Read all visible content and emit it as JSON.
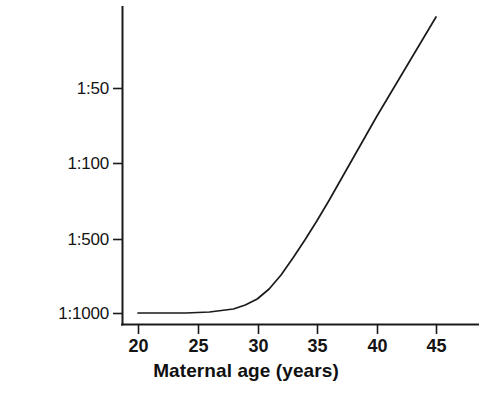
{
  "chart_data": {
    "type": "line",
    "title": "",
    "xlabel": "Maternal age (years)",
    "ylabel": "Frequency",
    "xlim": [
      20,
      45
    ],
    "ylim_labels": [
      "1:1000",
      "1:500",
      "1:100",
      "1:50"
    ],
    "grid": false,
    "legend": null,
    "axis_color": "#1a1a1a",
    "line_color": "#1a1a1a",
    "x_ticks": [
      {
        "label": "20",
        "value": 20,
        "px": 138
      },
      {
        "label": "25",
        "value": 25,
        "px": 198
      },
      {
        "label": "30",
        "value": 30,
        "px": 258
      },
      {
        "label": "35",
        "value": 35,
        "px": 317
      },
      {
        "label": "40",
        "value": 40,
        "px": 377
      },
      {
        "label": "45",
        "value": 45,
        "px": 436
      }
    ],
    "y_ticks": [
      {
        "label": "1:50",
        "value": 0.02,
        "px": 88
      },
      {
        "label": "1:100",
        "value": 0.01,
        "px": 163
      },
      {
        "label": "1:500",
        "value": 0.002,
        "px": 239
      },
      {
        "label": "1:1000",
        "value": 0.001,
        "px": 313
      }
    ],
    "series": [
      {
        "name": "Frequency vs maternal age",
        "x": [
          20,
          22,
          24,
          26,
          28,
          29,
          30,
          31,
          32,
          33,
          34,
          35,
          36,
          37,
          38,
          39,
          40,
          41,
          42,
          43,
          44,
          45
        ],
        "y_labels": [
          "1:1000",
          "1:1000",
          "1:1000",
          "1:1000",
          "1:1000",
          "1:950",
          "1:880",
          "1:780",
          "1:670",
          "1:560",
          "1:450",
          "1:360",
          "1:290",
          "1:230",
          "1:180",
          "1:140",
          "1:110",
          "1:85",
          "1:65",
          "1:50",
          "1:38",
          "1:30"
        ],
        "y_px": [
          313,
          313,
          313,
          312,
          309,
          305,
          299,
          289,
          275,
          258,
          240,
          221,
          201,
          180,
          159,
          138,
          117,
          97,
          77,
          57,
          37,
          17
        ]
      }
    ]
  },
  "axes": {
    "y_title": "Frequency",
    "x_title": "Maternal age (years)"
  }
}
